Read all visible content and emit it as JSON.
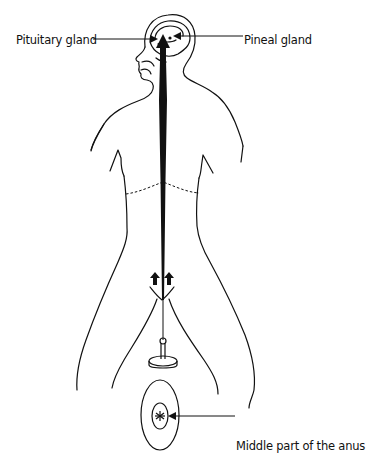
{
  "diagram": {
    "type": "anatomical-energy-flow",
    "labels": {
      "pituitary": "Pituitary gland",
      "pineal": "Pineal gland",
      "anus": "Middle part of the anus"
    },
    "colors": {
      "line": "#111111",
      "background": "#ffffff"
    }
  }
}
